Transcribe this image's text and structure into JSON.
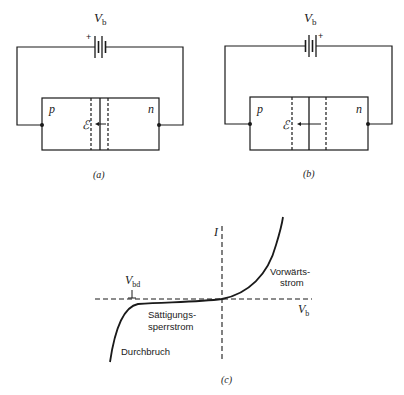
{
  "figure_a": {
    "battery_label": "V",
    "battery_sub": "b",
    "plus_sign": "+",
    "region_p": "p",
    "region_n": "n",
    "field_label": "ℰ",
    "caption": "(a)"
  },
  "figure_b": {
    "battery_label": "V",
    "battery_sub": "b",
    "plus_sign": "+",
    "region_p": "p",
    "region_n": "n",
    "field_label": "ℰ",
    "caption": "(b)"
  },
  "figure_c": {
    "y_axis_label": "I",
    "x_axis_label": "V",
    "x_axis_sub": "b",
    "breakdown_voltage_label": "V",
    "breakdown_voltage_sub": "bd",
    "forward_current_line1": "Vorwärts-",
    "forward_current_line2": "strom",
    "saturation_line1": "Sättigungs-",
    "saturation_line2": "sperrstrom",
    "breakdown_label": "Durchbruch",
    "caption": "(c)"
  },
  "colors": {
    "ink": "#1a1a1a",
    "background": "#ffffff"
  }
}
